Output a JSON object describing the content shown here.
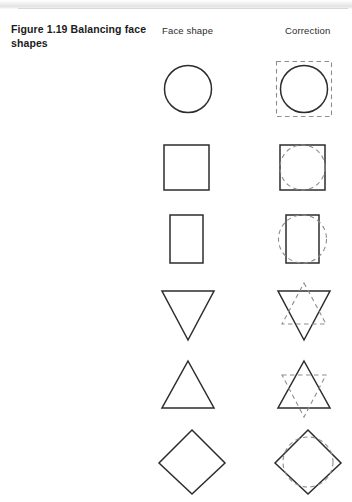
{
  "figure": {
    "caption": "Figure 1.19  Balancing face shapes",
    "columns": {
      "face_shape": "Face shape",
      "correction": "Correction"
    },
    "colors": {
      "solid_stroke": "#2c2c2c",
      "dashed_stroke": "#8d8d8d",
      "background": "#ffffff",
      "text": "#1b1b1b"
    }
  },
  "rows": [
    {
      "face_shape": "circle",
      "correction": "square",
      "correction_description": "dashed square drawn around the circle"
    },
    {
      "face_shape": "square",
      "correction": "circle",
      "correction_description": "dashed circle inscribed inside the square"
    },
    {
      "face_shape": "rectangle",
      "correction": "ellipse",
      "correction_description": "dashed ellipse drawn across the rectangle"
    },
    {
      "face_shape": "inverted-triangle",
      "correction": "upright-triangle",
      "correction_description": "dashed upright triangle forming a star"
    },
    {
      "face_shape": "triangle",
      "correction": "inverted-triangle",
      "correction_description": "dashed inverted triangle forming a star"
    },
    {
      "face_shape": "diamond",
      "correction": "circle",
      "correction_description": "dashed circle inscribed inside the diamond"
    }
  ]
}
